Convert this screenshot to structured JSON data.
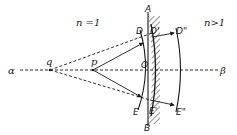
{
  "diagram": {
    "media": {
      "left": "n =1",
      "right": "n>1"
    },
    "axis": {
      "start_label": "α",
      "end_label": "β"
    },
    "points": {
      "q": "q",
      "p": "p",
      "O": "O",
      "A": "A",
      "B": "B",
      "D": "D",
      "D1": "D'",
      "D2": "D\"",
      "E": "E",
      "E1": "E'",
      "E2": "E\""
    },
    "colors": {
      "ink": "#1a1a1a",
      "background": "#ffffff"
    }
  }
}
